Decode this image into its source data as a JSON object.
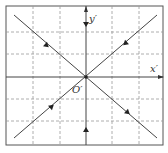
{
  "diagram": {
    "type": "phase-portrait-saddle",
    "axes": {
      "x_label": "x′",
      "y_label": "y′",
      "origin_label": "O′"
    },
    "colors": {
      "line": "#444444",
      "grid": "#999999",
      "frame": "#555555",
      "background": "#ffffff"
    },
    "frame": {
      "left": 6,
      "top": 6,
      "right": 163,
      "bottom": 145
    },
    "origin": {
      "x": 86,
      "y": 77
    },
    "grid_x": [
      33,
      60,
      112,
      139
    ],
    "grid_y": [
      32,
      54,
      99,
      121
    ],
    "trajectories": [
      {
        "name": "descending-diagonal",
        "from": [
          14,
          15
        ],
        "to": [
          157,
          138
        ]
      },
      {
        "name": "ascending-diagonal",
        "from": [
          14,
          138
        ],
        "to": [
          157,
          15
        ]
      }
    ],
    "arrows": [
      {
        "name": "arrow-upper-left",
        "x": 45,
        "y": 44,
        "direction": "down-right"
      },
      {
        "name": "arrow-lower-right",
        "x": 126,
        "y": 111,
        "direction": "down-right"
      },
      {
        "name": "arrow-upper-right",
        "x": 127,
        "y": 42,
        "direction": "down-left"
      },
      {
        "name": "arrow-lower-left",
        "x": 50,
        "y": 108,
        "direction": "up-right"
      },
      {
        "name": "arrow-y-top",
        "x": 86,
        "y": 22,
        "direction": "down"
      },
      {
        "name": "arrow-y-bottom",
        "x": 86,
        "y": 132,
        "direction": "up"
      }
    ]
  }
}
